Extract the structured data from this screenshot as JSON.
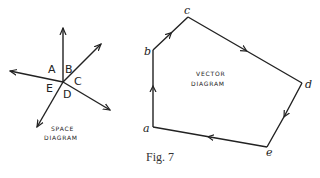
{
  "figure": {
    "caption": "Fig. 7"
  },
  "space_diagram": {
    "title_line1": "SPACE",
    "title_line2": "DIAGRAM",
    "regions": [
      "A",
      "B",
      "C",
      "D",
      "E"
    ]
  },
  "vector_diagram": {
    "title_line1": "VECTOR",
    "title_line2": "DIAGRAM",
    "vertices": [
      "a",
      "b",
      "c",
      "d",
      "e"
    ]
  }
}
